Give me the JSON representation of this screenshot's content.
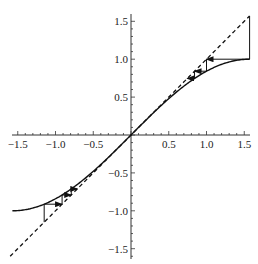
{
  "chart_data": {
    "type": "line",
    "title": "",
    "xlabel": "",
    "ylabel": "",
    "xlim": [
      -1.57,
      1.57
    ],
    "ylim": [
      -1.6,
      1.6
    ],
    "grid": false,
    "legend": null,
    "x_ticks": [
      -1.5,
      -1.0,
      -0.5,
      0.5,
      1.0,
      1.5
    ],
    "x_tick_labels": [
      "−1.5",
      "−1.0",
      "−0.5",
      "0.5",
      "1.0",
      "1.5"
    ],
    "y_ticks": [
      1.5,
      1.0,
      0.5,
      -0.5,
      -1.0,
      -1.5
    ],
    "y_tick_labels": [
      "1.5",
      "1.0",
      "0.5",
      "−0.5",
      "−1.0",
      "−1.5"
    ],
    "series": [
      {
        "name": "y = sin(x)",
        "style": "solid",
        "function": "sin",
        "x_range": [
          -1.5708,
          1.5708
        ]
      },
      {
        "name": "y = x",
        "style": "dashed",
        "function": "identity",
        "x_range": [
          -1.6,
          1.57
        ]
      }
    ],
    "cobweb": [
      {
        "name": "iteration from pi/2",
        "x0": 1.5708,
        "points": [
          [
            1.5708,
            1.5708
          ],
          [
            1.5708,
            1.0
          ],
          [
            1.0,
            1.0
          ],
          [
            1.0,
            0.8415
          ],
          [
            0.8415,
            0.8415
          ],
          [
            0.8415,
            0.7456
          ],
          [
            0.7456,
            0.7456
          ]
        ]
      },
      {
        "name": "iteration from -1.15",
        "x0": -1.15,
        "points": [
          [
            -1.15,
            -1.15
          ],
          [
            -1.15,
            -0.9128
          ],
          [
            -0.9128,
            -0.9128
          ],
          [
            -0.9128,
            -0.7914
          ],
          [
            -0.7914,
            -0.7914
          ],
          [
            -0.7914,
            -0.7114
          ],
          [
            -0.7114,
            -0.7114
          ]
        ]
      }
    ]
  }
}
